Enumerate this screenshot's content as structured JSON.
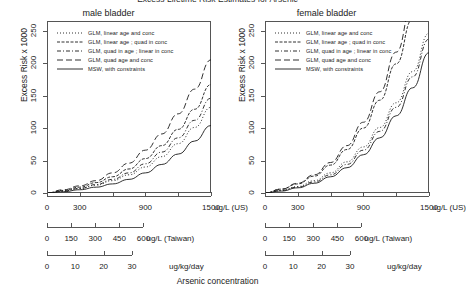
{
  "title": "Excess Lifetime Risk Estimates for Arsenic",
  "y_axis": {
    "label": "Excess Risk x 1000",
    "ticks": [
      0,
      50,
      100,
      150,
      200,
      250
    ],
    "min": 0,
    "max": 265
  },
  "x_axes": [
    {
      "unit": "ug/L (US)",
      "ticks": [
        0,
        300,
        600,
        900,
        1200,
        1500
      ],
      "labels": [
        "0",
        "300",
        "",
        "900",
        "",
        "1500"
      ],
      "min": 0,
      "max": 1700
    },
    {
      "unit": "ug/L (Taiwan)",
      "ticks": [
        0,
        150,
        300,
        450,
        600
      ],
      "labels": [
        "0",
        "150",
        "300",
        "450",
        "600"
      ],
      "min": 0,
      "max": 1700
    },
    {
      "unit": "ug/kg/day",
      "ticks": [
        0,
        10,
        20,
        30
      ],
      "labels": [
        "0",
        "10",
        "20",
        "30"
      ],
      "min": 0,
      "max": 1700
    }
  ],
  "x_axis_title": "Arsenic concentration",
  "legend": {
    "items": [
      {
        "label": "GLM, linear age and conc",
        "dash": "1,2"
      },
      {
        "label": "GLM, linear age ; quad in conc",
        "dash": "3,1.5"
      },
      {
        "label": "GLM, quad in age ; linear in conc",
        "dash": "4,2,1,2"
      },
      {
        "label": "GLM, quad age and conc",
        "dash": "6,3"
      },
      {
        "label": "MSW, with constraints",
        "dash": "none"
      }
    ]
  },
  "panels": [
    {
      "name": "male-bladder",
      "title": "male bladder",
      "chart_data": {
        "type": "line",
        "title": "male bladder",
        "xlabel": "Arsenic concentration",
        "ylabel": "Excess Risk x 1000",
        "xlim": [
          0,
          1700
        ],
        "ylim": [
          0,
          265
        ],
        "grid": false,
        "legend_position": "top-left",
        "x": [
          0,
          170,
          340,
          510,
          680,
          850,
          1020,
          1190,
          1360,
          1530,
          1700
        ],
        "series": [
          {
            "name": "GLM, linear age and conc",
            "dash": "1,2",
            "values": [
              0,
              3,
              7,
              12,
              19,
              28,
              40,
              56,
              76,
              101,
              132
            ]
          },
          {
            "name": "GLM, linear age ; quad in conc",
            "dash": "3,1.5",
            "values": [
              0,
              4,
              9,
              16,
              25,
              37,
              53,
              73,
              98,
              129,
              167
            ]
          },
          {
            "name": "GLM, quad in age ; linear in conc",
            "dash": "4,2,1,2",
            "values": [
              0,
              3,
              7,
              13,
              21,
              31,
              45,
              63,
              85,
              112,
              146
            ]
          },
          {
            "name": "GLM, quad age and conc",
            "dash": "6,3",
            "values": [
              0,
              5,
              11,
              19,
              31,
              46,
              66,
              91,
              122,
              160,
              205
            ]
          },
          {
            "name": "MSW, with constraints",
            "dash": "none",
            "values": [
              0,
              2,
              5,
              9,
              14,
              21,
              31,
              44,
              60,
              80,
              104
            ]
          }
        ]
      }
    },
    {
      "name": "female-bladder",
      "title": "female bladder",
      "chart_data": {
        "type": "line",
        "title": "female bladder",
        "xlabel": "Arsenic concentration",
        "ylabel": "Excess Risk x 1000",
        "xlim": [
          0,
          1700
        ],
        "ylim": [
          0,
          265
        ],
        "grid": false,
        "legend_position": "top-left",
        "x": [
          0,
          170,
          340,
          510,
          680,
          850,
          1020,
          1190,
          1360,
          1530,
          1700
        ],
        "series": [
          {
            "name": "GLM, linear age and conc",
            "dash": "1,2",
            "values": [
              0,
              4,
              10,
              19,
              31,
              48,
              71,
              101,
              139,
              187,
              246
            ]
          },
          {
            "name": "GLM, linear age ; quad in conc",
            "dash": "3,1.5",
            "values": [
              0,
              6,
              14,
              26,
              43,
              67,
              100,
              143,
              199,
              268,
              352
            ]
          },
          {
            "name": "GLM, quad in age ; linear in conc",
            "dash": "4,2,1,2",
            "values": [
              0,
              4,
              9,
              17,
              28,
              44,
              66,
              95,
              132,
              179,
              237
            ]
          },
          {
            "name": "GLM, quad age and conc",
            "dash": "6,3",
            "values": [
              0,
              6,
              15,
              28,
              47,
              73,
              109,
              156,
              217,
              292,
              382
            ]
          },
          {
            "name": "MSW, with constraints",
            "dash": "none",
            "values": [
              0,
              3,
              8,
              15,
              25,
              39,
              59,
              85,
              119,
              162,
              216
            ]
          }
        ]
      }
    }
  ],
  "colors": {
    "line": "#1a1a1a",
    "axis": "#555555",
    "text": "#222222",
    "background": "#ffffff"
  }
}
